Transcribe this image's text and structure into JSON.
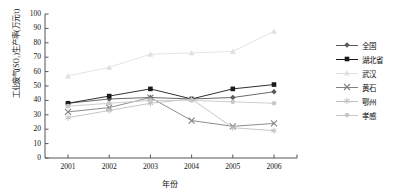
{
  "chart_data": {
    "type": "line",
    "title": "",
    "xlabel": "年份",
    "ylabel": "工业废气(SO₂)生产率(万元/t)",
    "categories": [
      "2001",
      "2002",
      "2003",
      "2004",
      "2005",
      "2006"
    ],
    "x": [
      2001,
      2002,
      2003,
      2004,
      2005,
      2006
    ],
    "ylim": [
      0,
      100
    ],
    "yticks": [
      "0",
      "10",
      "20",
      "30",
      "40",
      "50",
      "60",
      "70",
      "80",
      "90",
      "100"
    ],
    "ytick_values": [
      0,
      10,
      20,
      30,
      40,
      50,
      60,
      70,
      80,
      90,
      100
    ],
    "grid": false,
    "legend_position": "right",
    "series": [
      {
        "name": "全国",
        "marker": "diamond",
        "color": "#595959",
        "values": [
          38,
          41,
          42,
          41,
          42,
          46
        ]
      },
      {
        "name": "湖北省",
        "marker": "square",
        "color": "#1a1a1a",
        "values": [
          38,
          43,
          48,
          41,
          48,
          51
        ]
      },
      {
        "name": "武汉",
        "marker": "triangle",
        "color": "#e0e0e0",
        "values": [
          57,
          63,
          72,
          73,
          74,
          88
        ]
      },
      {
        "name": "黄石",
        "marker": "cross",
        "color": "#808080",
        "values": [
          32,
          35,
          42,
          26,
          22,
          24
        ]
      },
      {
        "name": "鄂州",
        "marker": "star",
        "color": "#bfbfbf",
        "values": [
          28,
          33,
          38,
          41,
          21,
          19
        ]
      },
      {
        "name": "孝感",
        "marker": "circle",
        "color": "#c8c8c8",
        "values": [
          36,
          38,
          40,
          40,
          39,
          38
        ]
      }
    ]
  },
  "axis": {
    "y_title": "工业废气(SO₂)生产率(万元/t)",
    "x_title": "年份"
  }
}
